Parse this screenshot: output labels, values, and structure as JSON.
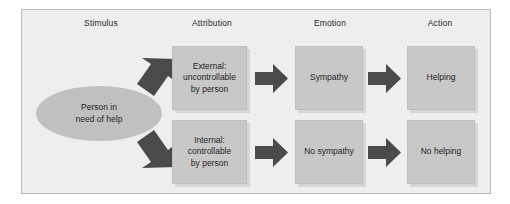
{
  "figure": {
    "frame_color": "#b9b9b9",
    "frame_background": "#eeeeee",
    "box_color": "#c8c8c8",
    "ellipse_color": "#c0c0c0",
    "arrow_color": "#4a4a4a"
  },
  "columns": [
    {
      "label": "Stimulus"
    },
    {
      "label": "Attribution"
    },
    {
      "label": "Emotion"
    },
    {
      "label": "Action"
    }
  ],
  "stimulus": {
    "label": "Person in\nneed of help",
    "line1": "Person in",
    "line2": "need of help"
  },
  "rows": [
    {
      "attribution": {
        "line1": "External:",
        "line2": "uncontrollable",
        "line3": "by person"
      },
      "emotion": {
        "label": "Sympathy"
      },
      "action": {
        "label": "Helping"
      }
    },
    {
      "attribution": {
        "line1": "Internal:",
        "line2": "controllable",
        "line3": "by person"
      },
      "emotion": {
        "label": "No sympathy"
      },
      "action": {
        "label": "No helping"
      }
    }
  ],
  "arrows": [
    {
      "name": "arrow-stimulus-to-external",
      "direction": "up-right"
    },
    {
      "name": "arrow-stimulus-to-internal",
      "direction": "down-right"
    },
    {
      "name": "arrow-external-to-sympathy",
      "direction": "right"
    },
    {
      "name": "arrow-sympathy-to-helping",
      "direction": "right"
    },
    {
      "name": "arrow-internal-to-nosympathy",
      "direction": "right"
    },
    {
      "name": "arrow-nosympathy-to-nohelping",
      "direction": "right"
    }
  ]
}
